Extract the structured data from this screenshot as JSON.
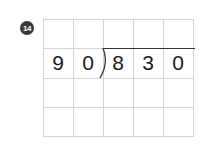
{
  "problem": {
    "number": "14",
    "divisor": [
      "9",
      "0"
    ],
    "dividend": [
      "8",
      "3",
      "0"
    ],
    "grid": {
      "columns": 5,
      "rows": 4
    }
  },
  "colors": {
    "badge": "#3a3a3a",
    "grid_line": "#d4d4d4",
    "digit": "#1a1a1a",
    "bracket": "#333333"
  }
}
